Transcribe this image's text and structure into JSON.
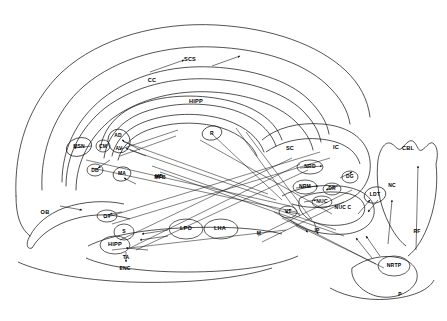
{
  "figure": {
    "type": "neuroanatomical-circuit-diagram",
    "caption": "",
    "stroke_color": "#1a1a1a",
    "background_color": "#ffffff",
    "label_color": "#000000"
  },
  "labels": [
    {
      "id": "scs",
      "text": "SCS",
      "x": 190,
      "y": 59,
      "size": "s6"
    },
    {
      "id": "cc",
      "text": "CC",
      "x": 152,
      "y": 80,
      "size": "s6"
    },
    {
      "id": "hipp_top",
      "text": "HIPP",
      "x": 196,
      "y": 101,
      "size": "s6"
    },
    {
      "id": "ad",
      "text": "AD",
      "x": 118,
      "y": 135,
      "size": "s5"
    },
    {
      "id": "av",
      "text": "AV",
      "x": 119,
      "y": 148,
      "size": "s5"
    },
    {
      "id": "cm",
      "text": "CM",
      "x": 103,
      "y": 146,
      "size": "s5"
    },
    {
      "id": "msn",
      "text": "MSN",
      "x": 79,
      "y": 146,
      "size": "s5"
    },
    {
      "id": "r",
      "text": "R",
      "x": 212,
      "y": 133,
      "size": "s5"
    },
    {
      "id": "db",
      "text": "DB",
      "x": 95,
      "y": 170,
      "size": "s5"
    },
    {
      "id": "ma",
      "text": "MA",
      "x": 122,
      "y": 173,
      "size": "s5"
    },
    {
      "id": "md",
      "text": "MD",
      "x": 159,
      "y": 176,
      "size": "s5"
    },
    {
      "id": "mfb",
      "text": "MFB",
      "x": 160,
      "y": 177,
      "size": "s5"
    },
    {
      "id": "ob",
      "text": "OB",
      "x": 45,
      "y": 212,
      "size": "s6"
    },
    {
      "id": "ot",
      "text": "OT",
      "x": 107,
      "y": 216,
      "size": "s5"
    },
    {
      "id": "s_nuc",
      "text": "S",
      "x": 124,
      "y": 231,
      "size": "s5"
    },
    {
      "id": "lpo",
      "text": "LPO",
      "x": 186,
      "y": 228,
      "size": "s6"
    },
    {
      "id": "lha",
      "text": "LHA",
      "x": 220,
      "y": 228,
      "size": "s6"
    },
    {
      "id": "m_nuc",
      "text": "M",
      "x": 259,
      "y": 233,
      "size": "s5"
    },
    {
      "id": "hipp_bot",
      "text": "HIPP",
      "x": 115,
      "y": 244,
      "size": "s6"
    },
    {
      "id": "ta",
      "text": "TA",
      "x": 126,
      "y": 257,
      "size": "s5"
    },
    {
      "id": "enc",
      "text": "ENC",
      "x": 125,
      "y": 268,
      "size": "s5"
    },
    {
      "id": "sc",
      "text": "SC",
      "x": 290,
      "y": 148,
      "size": "s6"
    },
    {
      "id": "ic",
      "text": "IC",
      "x": 336,
      "y": 147,
      "size": "s6"
    },
    {
      "id": "cbl",
      "text": "CBL",
      "x": 408,
      "y": 148,
      "size": "s6"
    },
    {
      "id": "nrd",
      "text": "NRD",
      "x": 310,
      "y": 166,
      "size": "s5"
    },
    {
      "id": "dg",
      "text": "DG",
      "x": 350,
      "y": 176,
      "size": "s5"
    },
    {
      "id": "nrm",
      "text": "NRM",
      "x": 305,
      "y": 186,
      "size": "s5"
    },
    {
      "id": "dr",
      "text": "DR",
      "x": 332,
      "y": 188,
      "size": "s5"
    },
    {
      "id": "ldt",
      "text": "LDT",
      "x": 375,
      "y": 194,
      "size": "s5"
    },
    {
      "id": "nuc",
      "text": "NUC",
      "x": 322,
      "y": 201,
      "size": "s5"
    },
    {
      "id": "nuc_c",
      "text": "NUC C",
      "x": 343,
      "y": 207,
      "size": "s5"
    },
    {
      "id": "nc",
      "text": "NC",
      "x": 392,
      "y": 185,
      "size": "s5"
    },
    {
      "id": "vt",
      "text": "VT",
      "x": 288,
      "y": 211,
      "size": "s5"
    },
    {
      "id": "ip",
      "text": "IP",
      "x": 317,
      "y": 230,
      "size": "s5"
    },
    {
      "id": "rf",
      "text": "RF",
      "x": 417,
      "y": 231,
      "size": "s5"
    },
    {
      "id": "nrtp",
      "text": "NRTP",
      "x": 394,
      "y": 265,
      "size": "s5"
    },
    {
      "id": "p",
      "text": "P",
      "x": 400,
      "y": 294,
      "size": "s5"
    }
  ],
  "structures": {
    "cortex_outline": "outer cerebral cortex contour",
    "corpus_callosum": "CC",
    "hippocampus_upper": "HIPP",
    "hippocampus_lower": "HIPP",
    "cerebellum": "CBL",
    "pons": "P",
    "olfactory_bulb": "OB",
    "superior_colliculus": "SC",
    "inferior_colliculus": "IC"
  }
}
